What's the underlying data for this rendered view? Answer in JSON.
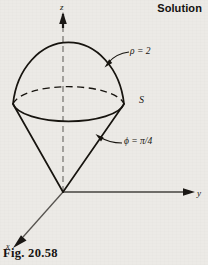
{
  "header": {
    "solution_label": "Solution"
  },
  "caption": {
    "figure_label": "Fig. 20.58"
  },
  "figure": {
    "axes": [
      {
        "name": "z",
        "label": "z"
      },
      {
        "name": "y",
        "label": "y"
      },
      {
        "name": "x",
        "label": "x"
      }
    ],
    "annotations": [
      {
        "name": "sphere-radius",
        "label": "ρ = 2"
      },
      {
        "name": "surface-name",
        "label": "S"
      },
      {
        "name": "cone-angle",
        "label": "ϕ = π/4"
      }
    ],
    "colors": {
      "ink": "#17140f",
      "axis_gray": "#6e6c68",
      "paper": "#eceae6"
    }
  }
}
